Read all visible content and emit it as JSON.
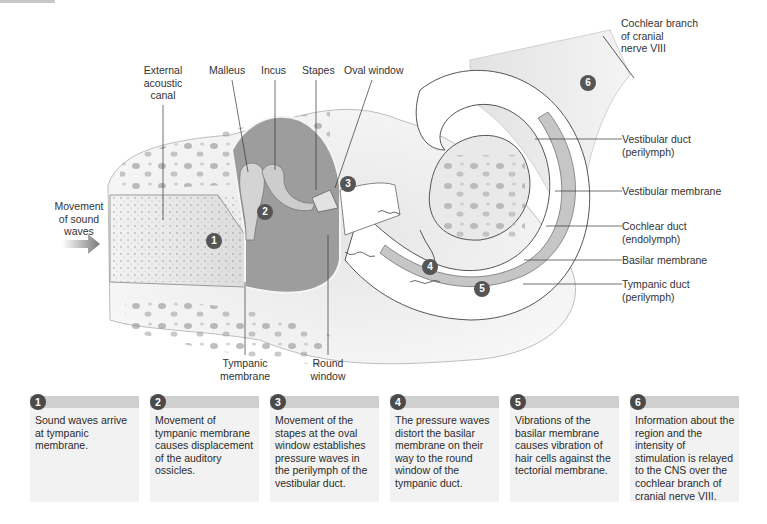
{
  "diagram": {
    "labels": {
      "external_acoustic_canal": "External\nacoustic\ncanal",
      "malleus": "Malleus",
      "incus": "Incus",
      "stapes": "Stapes",
      "oval_window": "Oval window",
      "cochlear_branch": "Cochlear branch\nof cranial\nnerve VIII",
      "vestibular_duct": "Vestibular duct\n(perilymph)",
      "vestibular_membrane": "Vestibular membrane",
      "cochlear_duct": "Cochlear duct\n(endolymph)",
      "basilar_membrane": "Basilar membrane",
      "tympanic_duct": "Tympanic duct\n(perilymph)",
      "movement_of_sound_waves": "Movement\nof sound\nwaves",
      "tympanic_membrane": "Tympanic\nmembrane",
      "round_window": "Round\nwindow"
    },
    "markers": [
      "1",
      "2",
      "3",
      "4",
      "5",
      "6"
    ],
    "colors": {
      "badge": "#555555",
      "step_header": "#cfcfcf",
      "step_body": "#f2f2f2",
      "bone": "#ececec",
      "cavity": "#9a9a9a",
      "duct_fill": "#ffffff",
      "membrane_band": "#c4c4c4"
    }
  },
  "steps": [
    {
      "number": "1",
      "text": "Sound waves arrive at tympanic membrane."
    },
    {
      "number": "2",
      "text": "Movement of tympanic membrane causes displacement of the auditory ossicles."
    },
    {
      "number": "3",
      "text": "Movement of the stapes at the oval window establishes pressure waves in the perilymph of the vestibular duct."
    },
    {
      "number": "4",
      "text": "The pressure waves distort the basilar membrane on their way to the round window of the tympanic duct."
    },
    {
      "number": "5",
      "text": "Vibrations of the basilar membrane causes vibration of hair cells against the tectorial membrane."
    },
    {
      "number": "6",
      "text": "Information about the region and the intensity of stimulation is relayed to the CNS over the cochlear branch of cranial nerve VIII."
    }
  ]
}
